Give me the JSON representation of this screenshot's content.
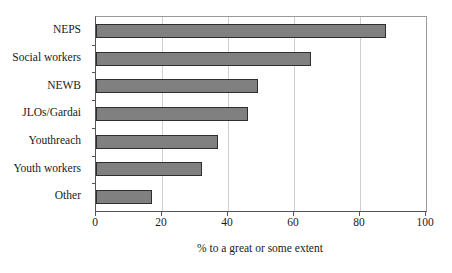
{
  "chart_data": {
    "type": "bar",
    "orientation": "horizontal",
    "title": "",
    "subtitle": "",
    "xlabel": "% to a great or some extent",
    "ylabel": "",
    "categories": [
      "NEPS",
      "Social workers",
      "NEWB",
      "JLOs/Gardai",
      "Youthreach",
      "Youth workers",
      "Other"
    ],
    "values": [
      88,
      65,
      49,
      46,
      37,
      32,
      17
    ],
    "series": [
      {
        "name": "% to a great or some extent",
        "values": [
          88,
          65,
          49,
          46,
          37,
          32,
          17
        ]
      }
    ],
    "xlim": [
      0,
      100
    ],
    "xticks": [
      0,
      20,
      40,
      60,
      80,
      100
    ],
    "xtick_labels": [
      "0",
      "20",
      "40",
      "60",
      "80",
      "100"
    ],
    "grid": "vertical",
    "legend": "none",
    "bar_fill_color": "#808080",
    "bar_border_color": "#2e2e2e",
    "gridline_color": "#cfcfcf",
    "axis_color": "#555555",
    "text_color": "#1a1a1a"
  }
}
